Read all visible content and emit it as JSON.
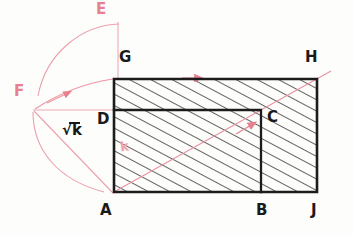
{
  "figure": {
    "background_color": "#fdfdfb",
    "ink_color_black": "#1a1a1a",
    "ink_color_red": "#e8808f",
    "hatch_color": "#2b2b2b"
  },
  "points": {
    "A": {
      "label": "A",
      "x": 113,
      "y": 193,
      "label_x": 102,
      "label_y": 203,
      "color": "black"
    },
    "B": {
      "label": "B",
      "x": 261,
      "y": 193,
      "label_x": 258,
      "label_y": 203,
      "color": "black"
    },
    "C": {
      "label": "C",
      "x": 261,
      "y": 110,
      "label_x": 268,
      "label_y": 110,
      "color": "black"
    },
    "D": {
      "label": "D",
      "x": 113,
      "y": 110,
      "label_x": 98,
      "label_y": 113,
      "color": "black"
    },
    "E": {
      "label": "E",
      "x": 118,
      "y": 22,
      "label_x": 98,
      "label_y": 3,
      "color": "red"
    },
    "F": {
      "label": "F",
      "x": 33,
      "y": 110,
      "label_x": 17,
      "label_y": 85,
      "color": "red"
    },
    "G": {
      "label": "G",
      "x": 113,
      "y": 78,
      "label_x": 120,
      "label_y": 52,
      "color": "black"
    },
    "H": {
      "label": "H",
      "x": 318,
      "y": 78,
      "label_x": 306,
      "label_y": 52,
      "color": "black"
    },
    "J": {
      "label": "J",
      "x": 318,
      "y": 193,
      "label_x": 312,
      "label_y": 203,
      "color": "black"
    }
  },
  "annotations": {
    "sqrt_k": {
      "text": "k",
      "prefix": "√",
      "x": 64,
      "y": 124,
      "color": "#161616"
    },
    "k": {
      "text": "k",
      "x": 122,
      "y": 146,
      "color": "#efa3ad"
    }
  },
  "shapes": {
    "outer_rectangle": {
      "name": "rectangle-AGHJ",
      "vertices": [
        "A",
        "G",
        "H",
        "J"
      ],
      "x": 113,
      "y": 78,
      "width": 205,
      "height": 115,
      "hatched": true
    },
    "inner_rectangle": {
      "name": "rectangle-ADCB",
      "vertices": [
        "A",
        "D",
        "C",
        "B"
      ],
      "x": 113,
      "y": 110,
      "width": 148,
      "height": 83,
      "hatched": true
    }
  },
  "red_construction": {
    "arc_large": {
      "from": "E",
      "to": "A",
      "center": "F",
      "radius": 88
    },
    "arc_small": {
      "from": "G",
      "to": "F",
      "description": "curve from F to G with arrowhead"
    },
    "line_horizontal": {
      "from": "F",
      "to": "D",
      "description": "horizontal line F to D"
    },
    "line_vertical": {
      "from": "E",
      "to": "G",
      "description": "vertical line E down to G"
    },
    "line_diagonal": {
      "from": "A",
      "to": "H",
      "description": "diagonal from A through C region to H with arrowheads"
    },
    "line_FA": {
      "from": "F",
      "to": "A",
      "description": "straight segment F to A"
    },
    "arrow_top_edge": {
      "on": "GH",
      "x": 196,
      "y": 78,
      "direction": "right"
    }
  }
}
